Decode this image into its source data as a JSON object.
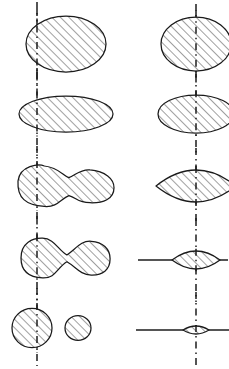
{
  "figure": {
    "background_color": "#ffffff",
    "ink_color": "#1a1a1a",
    "hatch_color": "#2b2b2b",
    "width": 229,
    "height": 369,
    "axis_style": "dash-dot vertical centre line",
    "fill_style": "45-degree diagonal hatching"
  },
  "columns": [
    {
      "name": "left-sequence",
      "label": "left-column",
      "axis_x": 37,
      "rows": [
        {
          "name": "left-row-1",
          "shape": "oblate-spheroid",
          "cx": 66,
          "cy": 44,
          "rx": 40,
          "ry": 28,
          "axis_top": 2,
          "axis_bottom": 86,
          "equator": false
        },
        {
          "name": "left-row-2",
          "shape": "flattened-ellipsoid",
          "cx": 66,
          "cy": 114,
          "rx": 47,
          "ry": 18,
          "axis_top": 72,
          "axis_bottom": 156,
          "equator": false
        },
        {
          "name": "left-row-3",
          "shape": "peanut-waisted",
          "cx": 66,
          "cy": 186,
          "rx": 48,
          "ry": 20,
          "axis_top": 146,
          "axis_bottom": 228,
          "equator": false
        },
        {
          "name": "left-row-4",
          "shape": "pinched-dumbbell",
          "cx": 66,
          "cy": 258,
          "rx": 45,
          "ry": 19,
          "axis_top": 216,
          "axis_bottom": 300,
          "equator": false
        },
        {
          "name": "left-row-5",
          "shape": "two-separated-spheres",
          "cx": 66,
          "cy": 328,
          "rx": 44,
          "ry": 20,
          "axis_top": 288,
          "axis_bottom": 366,
          "equator": false
        }
      ]
    },
    {
      "name": "right-sequence",
      "label": "right-column",
      "axis_x": 196,
      "rows": [
        {
          "name": "right-row-1",
          "shape": "oblate-spheroid",
          "cx": 196,
          "cy": 44,
          "rx": 35,
          "ry": 27,
          "axis_top": 4,
          "axis_bottom": 84,
          "equator": false
        },
        {
          "name": "right-row-2",
          "shape": "flattened-ellipsoid",
          "cx": 196,
          "cy": 114,
          "rx": 38,
          "ry": 19,
          "axis_top": 74,
          "axis_bottom": 154,
          "equator": false
        },
        {
          "name": "right-row-3",
          "shape": "lens-biconvex",
          "cx": 196,
          "cy": 186,
          "rx": 40,
          "ry": 16,
          "axis_top": 148,
          "axis_bottom": 226,
          "equator": false
        },
        {
          "name": "right-row-4",
          "shape": "thin-lens-with-disc-edge",
          "cx": 196,
          "cy": 260,
          "rx": 24,
          "ry": 9,
          "axis_top": 218,
          "axis_bottom": 302,
          "equator": true,
          "equator_x1": 138,
          "equator_x2": 228
        },
        {
          "name": "right-row-5",
          "shape": "very-thin-lens-with-disc-edge",
          "cx": 196,
          "cy": 330,
          "rx": 13,
          "ry": 4,
          "axis_top": 292,
          "axis_bottom": 368,
          "equator": true,
          "equator_x1": 136,
          "equator_x2": 229
        }
      ]
    }
  ]
}
